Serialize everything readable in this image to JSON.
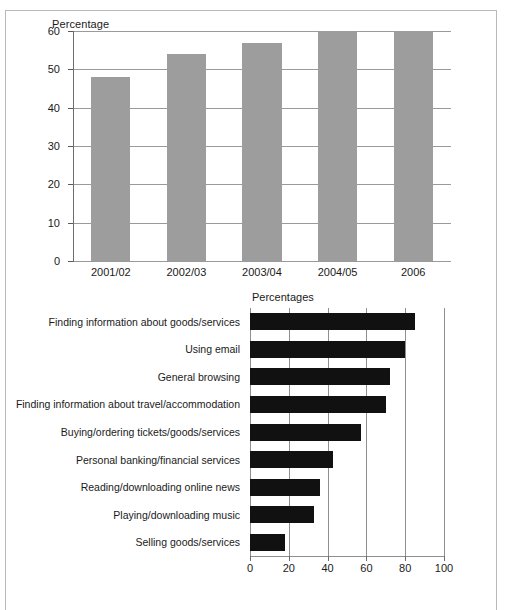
{
  "figure": {
    "background": "#ffffff",
    "frame_color": "#b9b9b9"
  },
  "chart_data": [
    {
      "id": "internet-access-over-time",
      "type": "bar",
      "orientation": "vertical",
      "title": "",
      "xlabel": "",
      "ylabel": "Percentage",
      "categories": [
        "2001/02",
        "2002/03",
        "2003/04",
        "2004/05",
        "2006"
      ],
      "values": [
        48,
        54,
        57,
        60,
        60
      ],
      "ylim": [
        0,
        60
      ],
      "yticks": [
        0,
        10,
        20,
        30,
        40,
        50,
        60
      ],
      "ytick_labels": [
        "0",
        "10",
        "20",
        "30",
        "40",
        "50",
        "60"
      ],
      "grid": true,
      "legend": "none",
      "bar_color": "#9d9d9d"
    },
    {
      "id": "internet-activities",
      "type": "bar",
      "orientation": "horizontal",
      "title": "Percentages",
      "xlabel": "",
      "ylabel": "",
      "categories": [
        "Finding information about goods/services",
        "Using email",
        "General browsing",
        "Finding information about travel/accommodation",
        "Buying/ordering tickets/goods/services",
        "Personal banking/financial services",
        "Reading/downloading online news",
        "Playing/downloading music",
        "Selling goods/services"
      ],
      "values": [
        85,
        80,
        72,
        70,
        57,
        43,
        36,
        33,
        18
      ],
      "xlim": [
        0,
        100
      ],
      "xticks": [
        0,
        20,
        40,
        60,
        80,
        100
      ],
      "xtick_labels": [
        "0",
        "20",
        "40",
        "60",
        "80",
        "100"
      ],
      "grid": true,
      "legend": "none",
      "bar_color": "#111111"
    }
  ]
}
